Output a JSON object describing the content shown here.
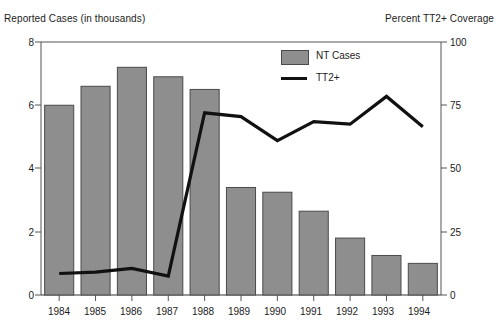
{
  "chart_data": {
    "type": "bar",
    "title": "",
    "categories": [
      "1984",
      "1985",
      "1986",
      "1987",
      "1988",
      "1989",
      "1990",
      "1991",
      "1992",
      "1993",
      "1994"
    ],
    "xlabel": "",
    "ylabel": "Reported Cases (in thousands)",
    "y2label": "Percent TT2+ Coverage",
    "ylim": [
      0,
      8
    ],
    "y2lim": [
      0,
      100
    ],
    "yticks": [
      "0",
      "2",
      "4",
      "6",
      "8"
    ],
    "y2ticks": [
      "0",
      "25",
      "50",
      "75",
      "100"
    ],
    "grid": false,
    "legend_position": "top-center",
    "series": [
      {
        "name": "NT Cases",
        "type": "bar",
        "axis": "left",
        "color": "#8e8e8e",
        "edge_color": "#4a4a4a",
        "values": [
          6.0,
          6.6,
          7.2,
          6.9,
          6.5,
          3.4,
          3.25,
          2.65,
          1.8,
          1.25,
          1.0
        ]
      },
      {
        "name": "TT2+",
        "type": "line",
        "axis": "right",
        "color": "#111111",
        "values": [
          8.5,
          9.0,
          10.5,
          7.5,
          72.0,
          70.5,
          61.0,
          68.5,
          67.5,
          78.5,
          66.5
        ]
      }
    ]
  },
  "legend": {
    "items": [
      {
        "label": "NT Cases",
        "marker": "filled-square"
      },
      {
        "label": "TT2+",
        "marker": "line-segment"
      }
    ]
  },
  "axes": {
    "left_title": "Reported Cases (in thousands)",
    "right_title": "Percent TT2+ Coverage"
  }
}
